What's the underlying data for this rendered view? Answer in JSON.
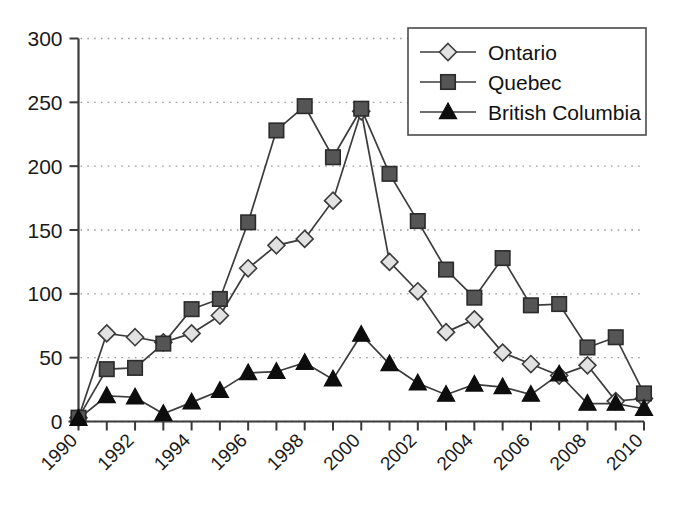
{
  "chart_data": {
    "type": "line",
    "title": "",
    "xlabel": "",
    "ylabel": "",
    "xlim": [
      1990,
      2010
    ],
    "ylim": [
      0,
      300
    ],
    "yticks": [
      0,
      50,
      100,
      150,
      200,
      250,
      300
    ],
    "xticks": [
      1990,
      1992,
      1994,
      1996,
      1998,
      2000,
      2002,
      2004,
      2006,
      2008,
      2010
    ],
    "xtick_labels": [
      "1990",
      "1992",
      "1994",
      "1996",
      "1998",
      "2000",
      "2002",
      "2004",
      "2006",
      "2008",
      "2010"
    ],
    "ytick_labels": [
      "0",
      "50",
      "100",
      "150",
      "200",
      "250",
      "300"
    ],
    "grid": "horizontal-dotted",
    "legend_position": "top-right",
    "x": [
      1990,
      1991,
      1992,
      1993,
      1994,
      1995,
      1996,
      1997,
      1998,
      1999,
      2000,
      2001,
      2002,
      2003,
      2004,
      2005,
      2006,
      2007,
      2008,
      2009,
      2010
    ],
    "series": [
      {
        "name": "Ontario",
        "marker": "diamond",
        "marker_fill": "#e2e2e2",
        "marker_stroke": "#3c3c3c",
        "values": [
          3,
          69,
          66,
          62,
          69,
          83,
          120,
          138,
          143,
          173,
          243,
          125,
          102,
          70,
          80,
          54,
          45,
          36,
          44,
          16,
          18
        ]
      },
      {
        "name": "Quebec",
        "marker": "square",
        "marker_fill": "#555555",
        "marker_stroke": "#2b2b2b",
        "values": [
          3,
          41,
          42,
          61,
          88,
          96,
          156,
          228,
          247,
          207,
          245,
          194,
          157,
          119,
          97,
          128,
          91,
          92,
          58,
          66,
          22
        ]
      },
      {
        "name": "British Columbia",
        "marker": "triangle",
        "marker_fill": "#0d0d0d",
        "marker_stroke": "#0d0d0d",
        "values": [
          2,
          20,
          19,
          6,
          15,
          24,
          38,
          39,
          46,
          33,
          68,
          45,
          30,
          21,
          29,
          27,
          21,
          37,
          14,
          14,
          10
        ]
      }
    ]
  },
  "legend": {
    "items": [
      {
        "label": "Ontario"
      },
      {
        "label": "Quebec"
      },
      {
        "label": "British Columbia"
      }
    ]
  }
}
